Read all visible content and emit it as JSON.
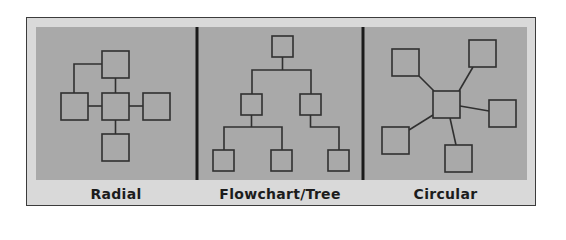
{
  "figure": {
    "colors": {
      "frame_background": "#d9d9d9",
      "frame_border": "#3c3c3c",
      "panel_background": "#a9a9a9",
      "node_fill": "#a9a9a9",
      "node_stroke": "#303030",
      "edge_stroke": "#303030",
      "divider": "#1a1a1a",
      "label_text": "#1c1c1c"
    },
    "sections": [
      {
        "id": "radial",
        "label": "Radial",
        "nodes": [
          "top",
          "center",
          "left",
          "right",
          "bottom"
        ],
        "edges": [
          [
            "center",
            "top"
          ],
          [
            "center",
            "left"
          ],
          [
            "center",
            "right"
          ],
          [
            "center",
            "bottom"
          ],
          [
            "top",
            "left"
          ]
        ]
      },
      {
        "id": "tree",
        "label": "Flowchart/Tree",
        "nodes": [
          "root",
          "mid-left",
          "mid-right",
          "leaf-1",
          "leaf-2",
          "leaf-3"
        ],
        "edges": [
          [
            "root",
            "mid-left"
          ],
          [
            "root",
            "mid-right"
          ],
          [
            "mid-left",
            "leaf-1"
          ],
          [
            "mid-left",
            "leaf-2"
          ],
          [
            "mid-right",
            "leaf-3"
          ]
        ]
      },
      {
        "id": "circular",
        "label": "Circular",
        "nodes": [
          "center",
          "top-left",
          "top-right",
          "right",
          "bottom",
          "bottom-left"
        ],
        "edges": [
          [
            "center",
            "top-left"
          ],
          [
            "center",
            "top-right"
          ],
          [
            "center",
            "right"
          ],
          [
            "center",
            "bottom"
          ],
          [
            "center",
            "bottom-left"
          ]
        ]
      }
    ]
  }
}
